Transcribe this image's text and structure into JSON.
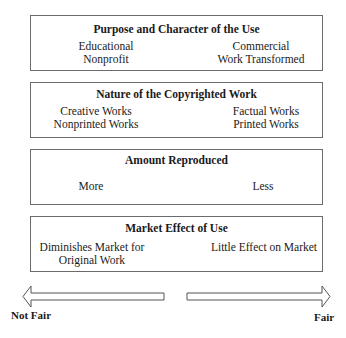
{
  "factors": [
    {
      "title": "Purpose and Character of the Use",
      "left": [
        "Educational",
        "Nonprofit"
      ],
      "right": [
        "Commercial",
        "Work Transformed"
      ]
    },
    {
      "title": "Nature of the Copyrighted Work",
      "left": [
        "Creative Works",
        "Nonprinted Works"
      ],
      "right": [
        "Factual Works",
        "Printed Works"
      ]
    },
    {
      "title": "Amount Reproduced",
      "left": [
        "More"
      ],
      "right": [
        "Less"
      ]
    },
    {
      "title": "Market Effect of Use",
      "left": [
        "Diminishes Market for",
        "Original Work"
      ],
      "right": [
        "Little Effect on Market"
      ]
    }
  ],
  "scale": {
    "left_label": "Not Fair",
    "right_label": "Fair"
  }
}
